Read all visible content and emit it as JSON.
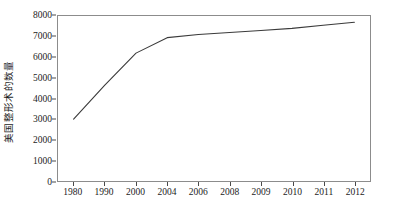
{
  "chart_data": {
    "type": "line",
    "title": "",
    "xlabel": "",
    "ylabel": "美国整形术的数量",
    "categories": [
      "1980",
      "1990",
      "2000",
      "2004",
      "2006",
      "2008",
      "2009",
      "2010",
      "2011",
      "2012"
    ],
    "values": [
      3000,
      4650,
      6200,
      6950,
      7100,
      7200,
      7300,
      7400,
      7550,
      7700
    ],
    "series": [
      {
        "name": "美国整形术的数量",
        "values": [
          3000,
          4650,
          6200,
          6950,
          7100,
          7200,
          7300,
          7400,
          7550,
          7700
        ]
      }
    ],
    "ylim": [
      0,
      8000
    ],
    "yticks": [
      0,
      1000,
      2000,
      3000,
      4000,
      5000,
      6000,
      7000,
      8000
    ],
    "ytick_labels": [
      "0",
      "1000",
      "2000",
      "3000",
      "4000",
      "5000",
      "6000",
      "7000",
      "8000"
    ],
    "xtick_labels": [
      "1980",
      "1990",
      "2000",
      "2004",
      "2006",
      "2008",
      "2009",
      "2010",
      "2011",
      "2012"
    ],
    "grid": false,
    "legend": false,
    "legend_position": "none",
    "line_color": "#3a3a3a",
    "axis_color": "#8c8c8c",
    "background_color": "#ffffff"
  }
}
